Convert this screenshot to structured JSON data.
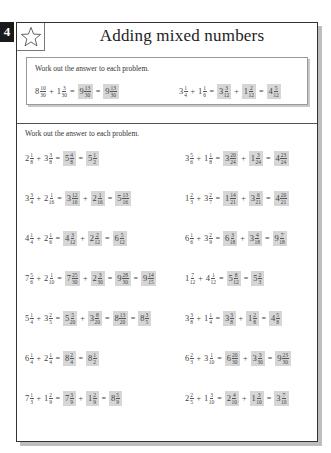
{
  "page_number": "4",
  "title": "Adding mixed numbers",
  "icon": "star-icon",
  "example": {
    "instruction": "Work out the answer to each problem.",
    "items": [
      {
        "terms": [
          {
            "w": "8",
            "n": "10",
            "d": "30"
          },
          {
            "w": "1",
            "n": "3",
            "d": "30"
          }
        ],
        "steps": [
          [
            {
              "w": "9",
              "n": "13",
              "d": "30",
              "op": "="
            }
          ],
          [
            {
              "w": "9",
              "n": "13",
              "d": "30",
              "op": "="
            }
          ]
        ]
      },
      {
        "terms": [
          {
            "w": "3",
            "n": "1",
            "d": "4"
          },
          {
            "w": "1",
            "n": "1",
            "d": "6"
          }
        ],
        "steps": [
          [
            {
              "w": "3",
              "n": "3",
              "d": "12",
              "op": "="
            },
            {
              "w": "1",
              "n": "2",
              "d": "12",
              "op": "+"
            }
          ],
          [
            {
              "w": "4",
              "n": "5",
              "d": "12",
              "op": "="
            }
          ]
        ]
      }
    ]
  },
  "main": {
    "instruction": "Work out the answer to each problem.",
    "rows": [
      [
        {
          "terms": [
            {
              "w": "2",
              "n": "1",
              "d": "8"
            },
            {
              "w": "3",
              "n": "3",
              "d": "8"
            }
          ],
          "steps": [
            [
              {
                "w": "5",
                "n": "4",
                "d": "8",
                "op": "="
              }
            ],
            [
              {
                "w": "5",
                "n": "1",
                "d": "2",
                "op": "="
              }
            ]
          ]
        },
        {
          "terms": [
            {
              "w": "3",
              "n": "5",
              "d": "6"
            },
            {
              "w": "1",
              "n": "1",
              "d": "8"
            }
          ],
          "steps": [
            [
              {
                "w": "3",
                "n": "20",
                "d": "24",
                "op": "="
              },
              {
                "w": "1",
                "n": "3",
                "d": "24",
                "op": "+"
              }
            ],
            [
              {
                "w": "4",
                "n": "23",
                "d": "24",
                "op": "="
              }
            ]
          ]
        }
      ],
      [
        {
          "terms": [
            {
              "w": "3",
              "n": "3",
              "d": "4"
            },
            {
              "w": "2",
              "n": "1",
              "d": "16"
            }
          ],
          "steps": [
            [
              {
                "w": "3",
                "n": "12",
                "d": "16",
                "op": "="
              },
              {
                "w": "2",
                "n": "1",
                "d": "16",
                "op": "+"
              }
            ],
            [
              {
                "w": "5",
                "n": "13",
                "d": "16",
                "op": "="
              }
            ]
          ]
        },
        {
          "terms": [
            {
              "w": "1",
              "n": "2",
              "d": "3"
            },
            {
              "w": "3",
              "n": "2",
              "d": "7"
            }
          ],
          "steps": [
            [
              {
                "w": "1",
                "n": "14",
                "d": "21",
                "op": "="
              },
              {
                "w": "3",
                "n": "6",
                "d": "21",
                "op": "+"
              }
            ],
            [
              {
                "w": "4",
                "n": "20",
                "d": "21",
                "op": "="
              }
            ]
          ]
        }
      ],
      [
        {
          "terms": [
            {
              "w": "4",
              "n": "1",
              "d": "4"
            },
            {
              "w": "2",
              "n": "1",
              "d": "6"
            }
          ],
          "steps": [
            [
              {
                "w": "4",
                "n": "3",
                "d": "12",
                "op": "="
              },
              {
                "w": "2",
                "n": "2",
                "d": "12",
                "op": "+"
              }
            ],
            [
              {
                "w": "6",
                "n": "5",
                "d": "12",
                "op": "="
              }
            ]
          ]
        },
        {
          "terms": [
            {
              "w": "6",
              "n": "1",
              "d": "6"
            },
            {
              "w": "3",
              "n": "2",
              "d": "9"
            }
          ],
          "steps": [
            [
              {
                "w": "6",
                "n": "3",
                "d": "18",
                "op": "="
              },
              {
                "w": "3",
                "n": "4",
                "d": "18",
                "op": "+"
              }
            ],
            [
              {
                "w": "9",
                "n": "7",
                "d": "18",
                "op": "="
              }
            ]
          ]
        }
      ],
      [
        {
          "terms": [
            {
              "w": "7",
              "n": "5",
              "d": "6"
            },
            {
              "w": "2",
              "n": "1",
              "d": "10"
            }
          ],
          "steps": [
            [
              {
                "w": "7",
                "n": "25",
                "d": "30",
                "op": "="
              },
              {
                "w": "2",
                "n": "3",
                "d": "30",
                "op": "+"
              }
            ],
            [
              {
                "w": "9",
                "n": "28",
                "d": "30",
                "op": "="
              }
            ],
            [
              {
                "w": "9",
                "n": "14",
                "d": "15",
                "op": "="
              }
            ]
          ]
        },
        {
          "terms": [
            {
              "w": "1",
              "n": "7",
              "d": "12"
            },
            {
              "w": "4",
              "n": "1",
              "d": "12"
            }
          ],
          "steps": [
            [
              {
                "w": "5",
                "n": "8",
                "d": "12",
                "op": "="
              }
            ],
            [
              {
                "w": "5",
                "n": "2",
                "d": "3",
                "op": "="
              }
            ]
          ]
        }
      ],
      [
        {
          "terms": [
            {
              "w": "5",
              "n": "1",
              "d": "4"
            },
            {
              "w": "3",
              "n": "2",
              "d": "5"
            }
          ],
          "steps": [
            [
              {
                "w": "5",
                "n": "5",
                "d": "20",
                "op": "="
              },
              {
                "w": "3",
                "n": "8",
                "d": "20",
                "op": "+"
              }
            ],
            [
              {
                "w": "8",
                "n": "13",
                "d": "20",
                "op": "="
              }
            ],
            [
              {
                "w": "8",
                "n": "3",
                "d": "5",
                "op": "="
              }
            ]
          ]
        },
        {
          "terms": [
            {
              "w": "3",
              "n": "3",
              "d": "8"
            },
            {
              "w": "1",
              "n": "1",
              "d": "4"
            }
          ],
          "steps": [
            [
              {
                "w": "3",
                "n": "3",
                "d": "8",
                "op": "="
              },
              {
                "w": "1",
                "n": "2",
                "d": "8",
                "op": "+"
              }
            ],
            [
              {
                "w": "4",
                "n": "5",
                "d": "8",
                "op": "="
              }
            ]
          ]
        }
      ],
      [
        {
          "terms": [
            {
              "w": "6",
              "n": "1",
              "d": "4"
            },
            {
              "w": "2",
              "n": "1",
              "d": "4"
            }
          ],
          "steps": [
            [
              {
                "w": "8",
                "n": "2",
                "d": "4",
                "op": "="
              }
            ],
            [
              {
                "w": "8",
                "n": "1",
                "d": "2",
                "op": "="
              }
            ]
          ]
        },
        {
          "terms": [
            {
              "w": "6",
              "n": "2",
              "d": "3"
            },
            {
              "w": "3",
              "n": "1",
              "d": "10"
            }
          ],
          "steps": [
            [
              {
                "w": "6",
                "n": "20",
                "d": "30",
                "op": "="
              },
              {
                "w": "3",
                "n": "3",
                "d": "30",
                "op": "+"
              }
            ],
            [
              {
                "w": "9",
                "n": "23",
                "d": "30",
                "op": "="
              }
            ]
          ]
        }
      ],
      [
        {
          "terms": [
            {
              "w": "7",
              "n": "1",
              "d": "3"
            },
            {
              "w": "1",
              "n": "2",
              "d": "9"
            }
          ],
          "steps": [
            [
              {
                "w": "7",
                "n": "3",
                "d": "9",
                "op": "="
              },
              {
                "w": "1",
                "n": "2",
                "d": "9",
                "op": "+"
              }
            ],
            [
              {
                "w": "8",
                "n": "5",
                "d": "9",
                "op": "="
              }
            ]
          ]
        },
        {
          "terms": [
            {
              "w": "2",
              "n": "2",
              "d": "5"
            },
            {
              "w": "1",
              "n": "3",
              "d": "10"
            }
          ],
          "steps": [
            [
              {
                "w": "2",
                "n": "4",
                "d": "10",
                "op": "="
              },
              {
                "w": "1",
                "n": "3",
                "d": "10",
                "op": "+"
              }
            ],
            [
              {
                "w": "3",
                "n": "7",
                "d": "10",
                "op": "="
              }
            ]
          ]
        }
      ]
    ]
  },
  "colors": {
    "answer_shade": "#d6d6d6",
    "page_tab": "#1a1a1a",
    "border": "#333333"
  }
}
